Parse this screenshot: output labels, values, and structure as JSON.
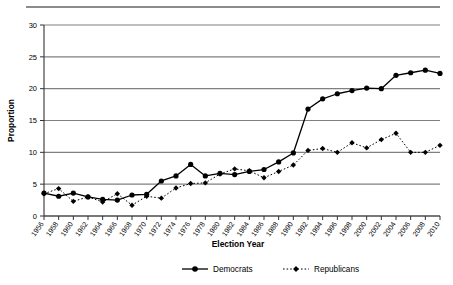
{
  "chart_data": {
    "type": "line",
    "title": "",
    "xlabel": "Election Year",
    "ylabel": "Proportion",
    "ylim": [
      0,
      30
    ],
    "yticks": [
      0,
      5,
      10,
      15,
      20,
      25,
      30
    ],
    "grid": true,
    "legend_position": "bottom",
    "categories": [
      "1956",
      "1958",
      "1960",
      "1962",
      "1964",
      "1966",
      "1968",
      "1970",
      "1972",
      "1974",
      "1976",
      "1978",
      "1980",
      "1982",
      "1984",
      "1986",
      "1988",
      "1990",
      "1992",
      "1994",
      "1996",
      "1998",
      "2000",
      "2002",
      "2004",
      "2006",
      "2008",
      "2010"
    ],
    "series": [
      {
        "name": "Democrats",
        "marker": "circle",
        "line_style": "solid",
        "color": "#000000",
        "values": [
          3.6,
          3.1,
          3.6,
          3.0,
          2.6,
          2.5,
          3.3,
          3.4,
          5.5,
          6.3,
          8.1,
          6.3,
          6.7,
          6.5,
          7.0,
          7.3,
          8.5,
          9.9,
          16.8,
          18.4,
          19.2,
          19.7,
          20.1,
          20.0,
          22.1,
          22.5,
          22.9,
          22.4
        ]
      },
      {
        "name": "Republicans",
        "marker": "diamond",
        "line_style": "dotted",
        "color": "#000000",
        "values": [
          3.5,
          4.3,
          2.3,
          3.0,
          2.2,
          3.5,
          1.7,
          3.1,
          2.8,
          4.4,
          5.1,
          5.2,
          6.6,
          7.4,
          7.1,
          6.0,
          7.0,
          8.0,
          10.3,
          10.6,
          10.0,
          11.5,
          10.7,
          12.0,
          13.0,
          10.0,
          10.0,
          11.1
        ]
      }
    ]
  },
  "legend": {
    "items": [
      {
        "label": "Democrats"
      },
      {
        "label": "Republicans"
      }
    ]
  }
}
